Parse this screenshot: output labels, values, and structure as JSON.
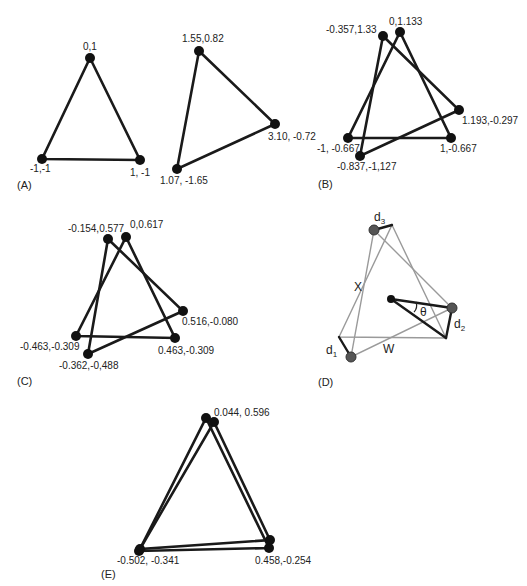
{
  "figure": {
    "panels": [
      {
        "id": "A",
        "label": "(A)",
        "label_pos": [
          17,
          189
        ],
        "triangles": [
          {
            "nodes": [
              {
                "x": 90,
                "y": 58,
                "text": "0,1",
                "tx": 83,
                "ty": 50
              },
              {
                "x": 140,
                "y": 160,
                "text": "1, -1",
                "tx": 130,
                "ty": 176
              },
              {
                "x": 42,
                "y": 159,
                "text": "-1,-1",
                "tx": 30,
                "ty": 172
              }
            ]
          },
          {
            "nodes": [
              {
                "x": 199,
                "y": 51,
                "text": "1.55,0.82",
                "tx": 182,
                "ty": 42
              },
              {
                "x": 275,
                "y": 124,
                "text": "3.10, -0.72",
                "tx": 268,
                "ty": 140
              },
              {
                "x": 177,
                "y": 169,
                "text": "1.07, -1.65",
                "tx": 160,
                "ty": 184
              }
            ]
          }
        ]
      },
      {
        "id": "B",
        "label": "(B)",
        "label_pos": [
          318,
          188
        ],
        "triangles": [
          {
            "nodes": [
              {
                "x": 400,
                "y": 32,
                "text": "0,1.133",
                "tx": 389,
                "ty": 25
              },
              {
                "x": 451,
                "y": 138,
                "text": "1,-0.667",
                "tx": 440,
                "ty": 152
              },
              {
                "x": 348,
                "y": 138,
                "text": "-1, -0.667",
                "tx": 317,
                "ty": 152
              }
            ]
          },
          {
            "nodes": [
              {
                "x": 383,
                "y": 36,
                "text": "-0.357,1.33",
                "tx": 326,
                "ty": 33
              },
              {
                "x": 459,
                "y": 110,
                "text": "1.193,-0.297",
                "tx": 462,
                "ty": 124
              },
              {
                "x": 360,
                "y": 156,
                "text": "-0.837,-1,127",
                "tx": 337,
                "ty": 170
              }
            ]
          }
        ]
      },
      {
        "id": "C",
        "label": "(C)",
        "label_pos": [
          17,
          385
        ],
        "triangles": [
          {
            "nodes": [
              {
                "x": 126,
                "y": 237,
                "text": "0,0.617",
                "tx": 130,
                "ty": 228
              },
              {
                "x": 175,
                "y": 338,
                "text": "0.463,-0.309",
                "tx": 158,
                "ty": 354
              },
              {
                "x": 76,
                "y": 336,
                "text": "-0.463,-0.309",
                "tx": 20,
                "ty": 350
              }
            ]
          },
          {
            "nodes": [
              {
                "x": 108,
                "y": 239,
                "text": "-0.154,0.577",
                "tx": 68,
                "ty": 232
              },
              {
                "x": 183,
                "y": 311,
                "text": "0.516,-0.080",
                "tx": 182,
                "ty": 325
              },
              {
                "x": 88,
                "y": 354,
                "text": "-0.362,-0,488",
                "tx": 59,
                "ty": 369
              }
            ]
          }
        ]
      },
      {
        "id": "D",
        "label": "(D)",
        "label_pos": [
          318,
          386
        ],
        "grey_triangles": [
          [
            [
              374,
              230
            ],
            [
              452,
              308
            ],
            [
              351,
              357
            ]
          ],
          [
            [
              392,
              225
            ],
            [
              446,
              338
            ],
            [
              339,
              337
            ]
          ]
        ],
        "offset_bars": [
          {
            "name": "d1",
            "from": [
              351,
              357
            ],
            "to": [
              339,
              337
            ],
            "text": "d",
            "sub": "1",
            "tx": 326,
            "ty": 354
          },
          {
            "name": "d2",
            "from": [
              452,
              308
            ],
            "to": [
              446,
              338
            ],
            "text": "d",
            "sub": "2",
            "tx": 454,
            "ty": 328
          },
          {
            "name": "d3",
            "from": [
              374,
              230
            ],
            "to": [
              392,
              225
            ],
            "text": "d",
            "sub": "3",
            "tx": 374,
            "ty": 221
          }
        ],
        "rotation": {
          "center": [
            391,
            299
          ],
          "arm1": [
            452,
            308
          ],
          "arm2": [
            446,
            338
          ],
          "symbol": "θ",
          "tx": 420,
          "ty": 316
        },
        "nodes": [
          {
            "x": 374,
            "y": 230
          },
          {
            "x": 452,
            "y": 308
          },
          {
            "x": 351,
            "y": 357
          }
        ],
        "side_labels": [
          {
            "text": "X",
            "tx": 354,
            "ty": 291
          },
          {
            "text": "W",
            "tx": 383,
            "ty": 353
          }
        ]
      },
      {
        "id": "E",
        "label": "(E)",
        "label_pos": [
          101,
          578
        ],
        "triangles": [
          {
            "nodes": [
              {
                "x": 206,
                "y": 418,
                "text": "",
                "tx": 0,
                "ty": 0
              },
              {
                "x": 269,
                "y": 548,
                "text": "0.458,-0.254",
                "tx": 255,
                "ty": 564
              },
              {
                "x": 139,
                "y": 551,
                "text": "-0.502, -0.341",
                "tx": 117,
                "ty": 564
              }
            ]
          },
          {
            "nodes": [
              {
                "x": 214,
                "y": 422,
                "text": "0.044, 0.596",
                "tx": 214,
                "ty": 416
              },
              {
                "x": 270,
                "y": 540,
                "text": "",
                "tx": 0,
                "ty": 0
              },
              {
                "x": 140,
                "y": 549,
                "text": "",
                "tx": 0,
                "ty": 0
              }
            ]
          }
        ]
      }
    ]
  }
}
